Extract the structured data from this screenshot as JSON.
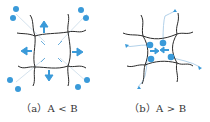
{
  "panels": [
    {
      "id": "a",
      "caption": "（a）A < B"
    },
    {
      "id": "b",
      "caption": "（b）A > B"
    }
  ],
  "colors": {
    "line": "#2b2b2b",
    "accent": "#3a9ad9",
    "faint": "#b8d6ec"
  }
}
